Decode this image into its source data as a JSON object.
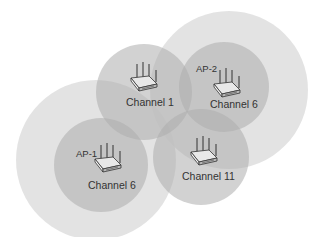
{
  "diagram": {
    "type": "wireless-channel-coverage",
    "colors": {
      "outer_cell": "#d9d9d9",
      "inner_cell": "#b3b3b3",
      "text": "#333333",
      "background": "#ffffff"
    },
    "access_points": [
      {
        "id": "ap1",
        "name": "AP-1",
        "channel_label": "Channel 6",
        "icon": "wireless-router-icon"
      },
      {
        "id": "ap2",
        "name": "AP-2",
        "channel_label": "Channel 6",
        "icon": "wireless-router-icon"
      },
      {
        "id": "ap3",
        "name": "",
        "channel_label": "Channel 1",
        "icon": "wireless-router-icon"
      },
      {
        "id": "ap4",
        "name": "",
        "channel_label": "Channel 11",
        "icon": "wireless-router-icon"
      }
    ]
  }
}
